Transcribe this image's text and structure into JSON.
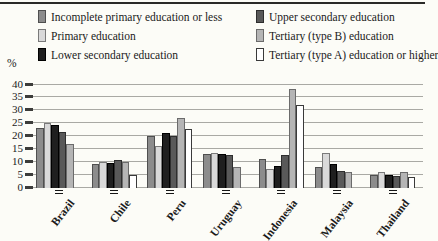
{
  "chart_data": {
    "type": "bar",
    "title": "",
    "ylabel": "%",
    "xlabel": "",
    "ylim": [
      0,
      40
    ],
    "ytick_step": 5,
    "grid": true,
    "legend_position": "top",
    "categories": [
      "Brazil",
      "Chile",
      "Peru",
      "Uruguay",
      "Indonesia",
      "Malaysia",
      "Thailand"
    ],
    "series": [
      {
        "name": "Incomplete primary education or less",
        "color": "#8c8c8c",
        "border": "#4f4f4f",
        "values": [
          23,
          9,
          20,
          13,
          11,
          8,
          5
        ]
      },
      {
        "name": "Primary education",
        "color": "#d9d9d9",
        "border": "#7a7a7a",
        "values": [
          25,
          10,
          16,
          13.5,
          7,
          13.5,
          6
        ]
      },
      {
        "name": "Lower secondary education",
        "color": "#1f1f1f",
        "border": "#000000",
        "values": [
          24,
          9.5,
          21,
          13,
          8.5,
          9,
          5
        ]
      },
      {
        "name": "Upper secondary education",
        "color": "#595959",
        "border": "#2e2e2e",
        "values": [
          21.5,
          10.5,
          20,
          12.5,
          12.5,
          6.5,
          4.5
        ]
      },
      {
        "name": "Tertiary (type B) education",
        "color": "#b5b5b5",
        "border": "#6b6b6b",
        "values": [
          17,
          10,
          27,
          8,
          38,
          6,
          6
        ]
      },
      {
        "name": "Tertiary (type A) education or higher",
        "color": "#ffffff",
        "border": "#3a3a3a",
        "values": [
          0,
          5,
          22.5,
          0,
          32,
          0,
          4
        ]
      }
    ]
  },
  "axis": {
    "percent_label": "%",
    "yticks": [
      0,
      5,
      10,
      15,
      20,
      25,
      30,
      35,
      40
    ]
  }
}
